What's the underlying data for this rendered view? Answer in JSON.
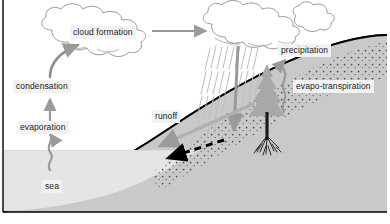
{
  "diagram": {
    "background_color": "#ffffff",
    "frame_color": "#000000",
    "labels": {
      "cloud_formation": "cloud formation",
      "condensation": "condensation",
      "evaporation": "evaporation",
      "sea": "sea",
      "runoff": "runoff",
      "precipitation": "precipitation",
      "evapotranspiration": "evapo-transpiration"
    },
    "label_style": {
      "background": "#f2f2f2",
      "text_color": "#1a1a1a"
    },
    "elements": {
      "cloud_left": "cloud-shape",
      "cloud_right": "rain-cloud-shape",
      "rain": "rain-streaks",
      "tree": "conifer-tree",
      "roots": "tree-roots",
      "sea_region": "sea-water-body",
      "ground_region": "land-ground",
      "soil_dots": "soil-infiltration-dots",
      "shoreline": "coastline-curve"
    },
    "arrows": {
      "evaporation_to_sea": "wavy-arrow-up",
      "evaporation_to_condensation": "straight-arrow-up",
      "condensation_to_cloud": "curved-arrow-up-right",
      "cloud_to_raincloud": "straight-arrow-right",
      "precipitation_down": "straight-arrow-down",
      "evapotranspiration_up": "wavy-arrow-up",
      "runoff_down_slope": "straight-arrow-down-left",
      "groundwater_flow": "dashed-arrow-left"
    },
    "colors": {
      "arrow_gray": "#9a9a9a",
      "sea_gray": "#e3e3e3",
      "ground_gray": "#c9c9c9",
      "tree_gray": "#a8a8a8",
      "outline_gray": "#8c8c8c",
      "dashed_arrow": "#000000"
    }
  }
}
